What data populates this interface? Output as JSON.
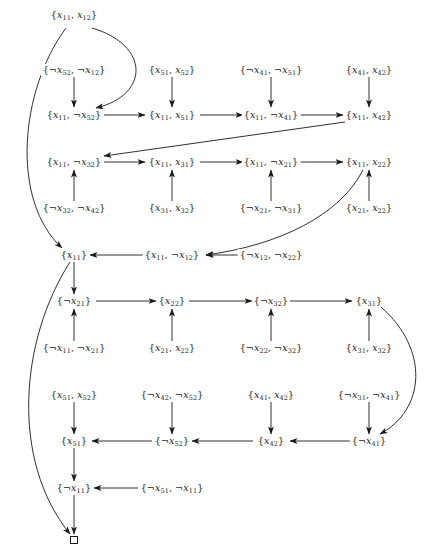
{
  "diagram": {
    "type": "resolution-refutation-dag",
    "empty_clause_symbol": "□",
    "nodes": [
      {
        "id": "n1",
        "label": "{x11, x12}",
        "x": 74,
        "y": 15
      },
      {
        "id": "n2",
        "label": "{¬x52, ¬x12}",
        "x": 74,
        "y": 70
      },
      {
        "id": "n3",
        "label": "{x51, x52}",
        "x": 172,
        "y": 70
      },
      {
        "id": "n4",
        "label": "{¬x41, ¬x51}",
        "x": 271,
        "y": 70
      },
      {
        "id": "n5",
        "label": "{x41, x42}",
        "x": 369,
        "y": 70
      },
      {
        "id": "n6",
        "label": "{x11, ¬x52}",
        "x": 74,
        "y": 115
      },
      {
        "id": "n7",
        "label": "{x11, x51}",
        "x": 172,
        "y": 115
      },
      {
        "id": "n8",
        "label": "{x11, ¬x41}",
        "x": 271,
        "y": 115
      },
      {
        "id": "n9",
        "label": "{x11, x42}",
        "x": 369,
        "y": 115
      },
      {
        "id": "n10",
        "label": "{x11, ¬x32}",
        "x": 74,
        "y": 162
      },
      {
        "id": "n11",
        "label": "{x11, x31}",
        "x": 172,
        "y": 162
      },
      {
        "id": "n12",
        "label": "{x11, ¬x21}",
        "x": 271,
        "y": 162
      },
      {
        "id": "n13",
        "label": "{x11, x22}",
        "x": 369,
        "y": 162
      },
      {
        "id": "n14",
        "label": "{¬x32, ¬x42}",
        "x": 74,
        "y": 208
      },
      {
        "id": "n15",
        "label": "{x31, x32}",
        "x": 172,
        "y": 208
      },
      {
        "id": "n16",
        "label": "{¬x21, ¬x31}",
        "x": 271,
        "y": 208
      },
      {
        "id": "n17",
        "label": "{x21, x22}",
        "x": 369,
        "y": 208
      },
      {
        "id": "n18",
        "label": "{x11}",
        "x": 74,
        "y": 255
      },
      {
        "id": "n19",
        "label": "{x11, ¬x12}",
        "x": 172,
        "y": 255
      },
      {
        "id": "n20",
        "label": "{¬x12, ¬x22}",
        "x": 271,
        "y": 255
      },
      {
        "id": "n21",
        "label": "{¬x21}",
        "x": 74,
        "y": 301
      },
      {
        "id": "n22",
        "label": "{x22}",
        "x": 172,
        "y": 301
      },
      {
        "id": "n23",
        "label": "{¬x32}",
        "x": 271,
        "y": 301
      },
      {
        "id": "n24",
        "label": "{x31}",
        "x": 369,
        "y": 301
      },
      {
        "id": "n25",
        "label": "{¬x11, ¬x21}",
        "x": 74,
        "y": 348
      },
      {
        "id": "n26",
        "label": "{x21, x22}",
        "x": 172,
        "y": 348
      },
      {
        "id": "n27",
        "label": "{¬x22, ¬x32}",
        "x": 271,
        "y": 348
      },
      {
        "id": "n28",
        "label": "{x31, x32}",
        "x": 369,
        "y": 348
      },
      {
        "id": "n29",
        "label": "{x51, x52}",
        "x": 74,
        "y": 395
      },
      {
        "id": "n30",
        "label": "{¬x42, ¬x52}",
        "x": 172,
        "y": 395
      },
      {
        "id": "n31",
        "label": "{x41, x42}",
        "x": 271,
        "y": 395
      },
      {
        "id": "n32",
        "label": "{¬x31, ¬x41}",
        "x": 369,
        "y": 395
      },
      {
        "id": "n33",
        "label": "{x51}",
        "x": 74,
        "y": 441
      },
      {
        "id": "n34",
        "label": "{¬x52}",
        "x": 172,
        "y": 441
      },
      {
        "id": "n35",
        "label": "{x42}",
        "x": 271,
        "y": 441
      },
      {
        "id": "n36",
        "label": "{¬x41}",
        "x": 369,
        "y": 441
      },
      {
        "id": "n37",
        "label": "{¬x11}",
        "x": 74,
        "y": 488
      },
      {
        "id": "n38",
        "label": "{¬x51, ¬x11}",
        "x": 172,
        "y": 488
      },
      {
        "id": "n39",
        "label": "□",
        "x": 74,
        "y": 540
      }
    ],
    "edges": [
      {
        "from": "n1",
        "to": "n6",
        "curve": "right"
      },
      {
        "from": "n1",
        "to": "n18",
        "curve": "left"
      },
      {
        "from": "n2",
        "to": "n6"
      },
      {
        "from": "n3",
        "to": "n7"
      },
      {
        "from": "n4",
        "to": "n8"
      },
      {
        "from": "n5",
        "to": "n9"
      },
      {
        "from": "n6",
        "to": "n7"
      },
      {
        "from": "n7",
        "to": "n8"
      },
      {
        "from": "n8",
        "to": "n9"
      },
      {
        "from": "n9",
        "to": "n10"
      },
      {
        "from": "n10",
        "to": "n11"
      },
      {
        "from": "n11",
        "to": "n12"
      },
      {
        "from": "n12",
        "to": "n13"
      },
      {
        "from": "n14",
        "to": "n10"
      },
      {
        "from": "n15",
        "to": "n11"
      },
      {
        "from": "n16",
        "to": "n12"
      },
      {
        "from": "n17",
        "to": "n13"
      },
      {
        "from": "n13",
        "to": "n19",
        "curve": "down"
      },
      {
        "from": "n20",
        "to": "n19"
      },
      {
        "from": "n19",
        "to": "n18"
      },
      {
        "from": "n18",
        "to": "n21"
      },
      {
        "from": "n18",
        "to": "n39",
        "curve": "left"
      },
      {
        "from": "n21",
        "to": "n22"
      },
      {
        "from": "n22",
        "to": "n23"
      },
      {
        "from": "n23",
        "to": "n24"
      },
      {
        "from": "n25",
        "to": "n21"
      },
      {
        "from": "n26",
        "to": "n22"
      },
      {
        "from": "n27",
        "to": "n23"
      },
      {
        "from": "n28",
        "to": "n24"
      },
      {
        "from": "n24",
        "to": "n36",
        "curve": "right"
      },
      {
        "from": "n29",
        "to": "n33"
      },
      {
        "from": "n30",
        "to": "n34"
      },
      {
        "from": "n31",
        "to": "n35"
      },
      {
        "from": "n32",
        "to": "n36"
      },
      {
        "from": "n36",
        "to": "n35"
      },
      {
        "from": "n35",
        "to": "n34"
      },
      {
        "from": "n34",
        "to": "n33"
      },
      {
        "from": "n33",
        "to": "n37"
      },
      {
        "from": "n38",
        "to": "n37"
      },
      {
        "from": "n37",
        "to": "n39"
      }
    ]
  }
}
